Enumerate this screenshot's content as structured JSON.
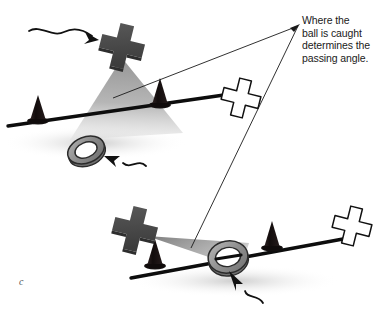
{
  "figure": {
    "panel_label": "c",
    "annotation": {
      "lines": [
        "Where the",
        "ball is caught",
        "determines the",
        "passing angle."
      ],
      "full_text": "Where the ball is caught determines the passing angle."
    },
    "colors": {
      "background": "#ffffff",
      "dark_player_x": "#4a4a4a",
      "dark_player_x_shade": "#33333 3",
      "white_player_x_fill": "#ffffff",
      "white_player_x_stroke": "#111111",
      "cone_dark": "#161010",
      "line_black": "#0d0d0d",
      "shadow_wedge": "#9a9a9a",
      "ring_gray": "#8c8c8c",
      "ring_stroke": "#2b2b2b",
      "ground_shadow": "#d6d6d6",
      "leader_line": "#1a1a1a",
      "text": "#1a1a1a",
      "label_text": "#555555"
    },
    "scenes": [
      {
        "name": "top-scene",
        "description": "Defender line with dark attacker above producing a wide passing angle wedge",
        "line": {
          "x1": 8,
          "y1": 126,
          "x2": 222,
          "y2": 96
        },
        "dark_x": {
          "cx": 122,
          "cy": 47,
          "size": 40,
          "rotation": 12
        },
        "white_x": {
          "cx": 241,
          "cy": 98,
          "size": 36,
          "rotation": 14
        },
        "cones": [
          {
            "cx": 38,
            "cy": 116
          },
          {
            "cx": 160,
            "cy": 100
          }
        ],
        "ring": {
          "cx": 86,
          "cy": 150,
          "rx": 20,
          "ry": 16,
          "rotation": -24
        },
        "wedge_apex": {
          "x": 122,
          "y": 60
        },
        "wedge_left": {
          "x": 66,
          "y": 135
        },
        "wedge_right": {
          "x": 178,
          "y": 128
        },
        "squiggle_arrow": {
          "from_x": 31,
          "from_y": 30,
          "to_x": 97,
          "to_y": 35
        },
        "ring_arrow": {
          "from_x": 141,
          "from_y": 164,
          "to_x": 104,
          "to_y": 155
        },
        "leader_end": {
          "x": 113,
          "y": 98
        }
      },
      {
        "name": "bottom-scene",
        "description": "Defender line with dark attacker beside it producing a narrow passing angle wedge",
        "line": {
          "x1": 131,
          "y1": 277,
          "x2": 341,
          "y2": 240
        },
        "dark_x": {
          "cx": 136,
          "cy": 227,
          "size": 40,
          "rotation": 12
        },
        "white_x": {
          "cx": 352,
          "cy": 225,
          "size": 36,
          "rotation": 14
        },
        "cones": [
          {
            "cx": 155,
            "cy": 260
          },
          {
            "cx": 272,
            "cy": 243
          }
        ],
        "ring": {
          "cx": 228,
          "cy": 257,
          "rx": 21,
          "ry": 18,
          "rotation": -12
        },
        "wedge_apex": {
          "x": 150,
          "y": 239
        },
        "wedge_top": {
          "x": 243,
          "y": 240
        },
        "wedge_bottom": {
          "x": 233,
          "y": 262
        },
        "ring_arrow": {
          "from_x": 253,
          "from_y": 296,
          "to_x": 231,
          "to_y": 272
        },
        "leader_end": {
          "x": 191,
          "y": 248
        }
      }
    ],
    "leader_lines": {
      "origin": {
        "x": 298,
        "y": 26
      },
      "targets": [
        {
          "x": 113,
          "y": 98,
          "scene": "top-scene"
        },
        {
          "x": 191,
          "y": 248,
          "scene": "bottom-scene"
        }
      ]
    }
  }
}
